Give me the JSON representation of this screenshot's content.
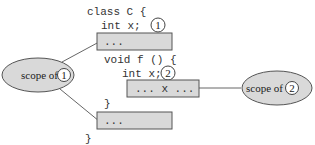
{
  "code": {
    "line1": "class C {",
    "line2": "int x;",
    "line3": "void f () {",
    "line4": "int x;",
    "line5": "}",
    "line6": "}"
  },
  "boxes": {
    "box1": "...",
    "box2": "... x ...",
    "box3": "..."
  },
  "markers": {
    "m1": "1",
    "m2": "2"
  },
  "scopes": {
    "scope1": {
      "label": "scope of",
      "marker": "1"
    },
    "scope2": {
      "label": "scope of",
      "marker": "2"
    }
  },
  "colors": {
    "box_fill": "#d9d9d9",
    "ellipse_fill": "#d9d9d9",
    "stroke": "#555555"
  }
}
